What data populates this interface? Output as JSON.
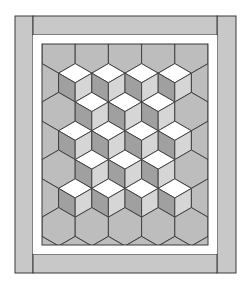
{
  "illustration": {
    "subject": "Tumbling blocks quilt pattern",
    "colors": {
      "background": "#ffffff",
      "border_strip": "#c8c8c8",
      "inner_border": "#ffffff",
      "plain_hex": "#bdbdbd",
      "cube_top": "#ffffff",
      "cube_left": "#a0a0a0",
      "cube_right": "#d6d6d6",
      "line": "#3a3a3a"
    },
    "outer_border": {
      "left": {
        "x": 15,
        "y": 16,
        "w": 18,
        "h": 257
      },
      "right": {
        "x": 217,
        "y": 16,
        "w": 19,
        "h": 257
      },
      "top": {
        "x": 33,
        "y": 16,
        "w": 184,
        "h": 19
      },
      "bottom": {
        "x": 33,
        "y": 254,
        "w": 184,
        "h": 19
      }
    },
    "inner_white_frame": {
      "x": 33,
      "y": 35,
      "w": 184,
      "h": 219
    },
    "quilt_field": {
      "x": 42,
      "y": 44,
      "w": 166,
      "h": 201
    },
    "hex_grid": {
      "hex_half_width": 16.6,
      "hex_side": 19.2,
      "row_pitch": 28.8,
      "first_row_y": 54,
      "even_row_x0": 58.6,
      "odd_row_x0": 42,
      "col_pitch": 33.2,
      "rows": [
        {
          "cols": 5,
          "cubes": []
        },
        {
          "cols": 6,
          "cubes": [
            1,
            2,
            3,
            4
          ]
        },
        {
          "cols": 5,
          "cubes": [
            1,
            2,
            3
          ]
        },
        {
          "cols": 6,
          "cubes": [
            1,
            2,
            3,
            4
          ]
        },
        {
          "cols": 5,
          "cubes": [
            1,
            2,
            3
          ]
        },
        {
          "cols": 6,
          "cubes": [
            1,
            2,
            3,
            4
          ]
        },
        {
          "cols": 5,
          "cubes": []
        },
        {
          "cols": 6,
          "cubes": []
        }
      ]
    }
  }
}
